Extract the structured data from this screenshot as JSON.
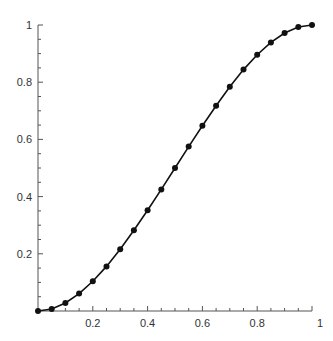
{
  "chart_data": {
    "type": "line",
    "title": "",
    "xlabel": "",
    "ylabel": "",
    "xlim": [
      0,
      1
    ],
    "ylim": [
      0,
      1
    ],
    "grid": false,
    "legend": null,
    "x_ticks": [
      0.2,
      0.4,
      0.6,
      0.8,
      1
    ],
    "x_tick_labels": [
      "0.2",
      "0.4",
      "0.6",
      "0.8",
      "1"
    ],
    "y_ticks": [
      0.2,
      0.4,
      0.6,
      0.8,
      1
    ],
    "y_tick_labels": [
      "0.2",
      "0.4",
      "0.6",
      "0.8",
      "1"
    ],
    "minor_tick_step": 0.05,
    "series": [
      {
        "name": "curve",
        "color": "#111111",
        "marker": "circle",
        "x": [
          0,
          0.05,
          0.1,
          0.15,
          0.2,
          0.25,
          0.3,
          0.35,
          0.4,
          0.45,
          0.5,
          0.55,
          0.6,
          0.65,
          0.7,
          0.75,
          0.8,
          0.85,
          0.9,
          0.95,
          1
        ],
        "y": [
          0,
          0.007,
          0.028,
          0.061,
          0.104,
          0.156,
          0.216,
          0.282,
          0.352,
          0.425,
          0.5,
          0.575,
          0.648,
          0.718,
          0.784,
          0.844,
          0.896,
          0.939,
          0.972,
          0.993,
          1
        ]
      }
    ]
  }
}
